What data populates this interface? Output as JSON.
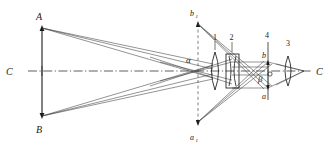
{
  "figure": {
    "background_color": "#ffffff",
    "line_color": "#1a1a1a",
    "axis_style": "dash-dot",
    "image_plane_style": "dashed"
  },
  "labels": {
    "object_top": "A",
    "object_bottom": "B",
    "axis_left": "C",
    "axis_right": "C",
    "intermediate_image": "α",
    "final_image_point": "β",
    "image_top": "b",
    "image_bottom": "a",
    "virtual_top": "b",
    "virtual_top_sub": "1",
    "virtual_bottom": "a",
    "virtual_bottom_sub": "1",
    "element_1": "1",
    "element_2": "2",
    "element_3": "3",
    "element_4": "4"
  },
  "elements": [
    {
      "id": "element-1",
      "label": "1",
      "type": "biconvex-lens",
      "x": 215,
      "y": 70
    },
    {
      "id": "element-2",
      "label": "2",
      "type": "biconcave-lens-in-mount",
      "x": 233,
      "y": 70
    },
    {
      "id": "element-3",
      "label": "3",
      "type": "eyepiece-lens",
      "x": 288,
      "y": 70
    },
    {
      "id": "element-4",
      "label": "4",
      "type": "image-plane",
      "x": 268,
      "y": 70
    }
  ],
  "points": {
    "A": {
      "x": 42,
      "y": 26
    },
    "B": {
      "x": 42,
      "y": 116
    },
    "C_left": {
      "x": 18,
      "y": 71
    },
    "C_right": {
      "x": 314,
      "y": 71
    },
    "alpha": {
      "x": 198,
      "y": 71
    },
    "beta": {
      "x": 268,
      "y": 78
    },
    "b": {
      "x": 268,
      "y": 62
    },
    "a": {
      "x": 268,
      "y": 88
    },
    "b1": {
      "x": 198,
      "y": 22
    },
    "a1": {
      "x": 198,
      "y": 124
    }
  },
  "axis": {
    "y": 71,
    "x_start": 28,
    "x_end": 312
  }
}
